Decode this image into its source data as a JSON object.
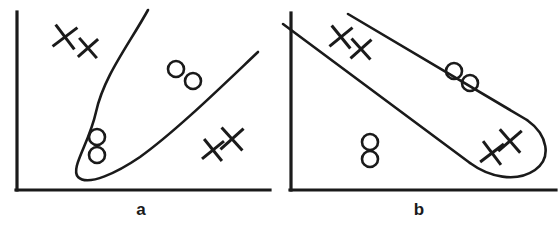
{
  "figure": {
    "background_color": "#ffffff",
    "ink_color": "#1a1a1a",
    "width": 559,
    "height": 231
  },
  "panels": [
    {
      "id": "panel-a",
      "label": "a",
      "label_position": {
        "x": 141,
        "y": 215
      },
      "axes": {
        "y_axis": {
          "x": 17,
          "y_top": 12,
          "y_bottom": 190
        },
        "x_axis": {
          "y": 190,
          "x_left": 17,
          "x_right": 270
        }
      },
      "boundary": {
        "shape": "open-u-curve",
        "description": "Elongated narrow U-shaped cluster boundary opening toward the upper right",
        "path": "M 148 10 C 128 46, 104 76, 96 112 C 89 144, 70 168, 78 177 C 88 187, 118 172, 140 157 C 176 131, 220 88, 258 52"
      },
      "points": {
        "circles": [
          {
            "cx": 97,
            "cy": 137,
            "r": 8,
            "inside_boundary": true
          },
          {
            "cx": 97,
            "cy": 155,
            "r": 8,
            "inside_boundary": true
          },
          {
            "cx": 176,
            "cy": 69,
            "r": 8,
            "inside_boundary": false
          },
          {
            "cx": 193,
            "cy": 81,
            "r": 8,
            "inside_boundary": false
          }
        ],
        "crosses": [
          {
            "cx": 65,
            "cy": 37,
            "size": 22,
            "rotation": 8
          },
          {
            "cx": 88,
            "cy": 48,
            "size": 19,
            "rotation": 4
          },
          {
            "cx": 213,
            "cy": 150,
            "size": 20,
            "rotation": 6
          },
          {
            "cx": 232,
            "cy": 139,
            "size": 22,
            "rotation": 3
          }
        ]
      }
    },
    {
      "id": "panel-b",
      "label": "b",
      "label_position": {
        "x": 419,
        "y": 215
      },
      "axes": {
        "y_axis": {
          "x": 291,
          "y_top": 13,
          "y_bottom": 190
        },
        "x_axis": {
          "y": 190,
          "x_left": 291,
          "x_right": 556
        }
      },
      "boundary": {
        "shape": "elongated-slanted-capsule",
        "description": "Long diagonal capsule-shaped cluster boundary sloping down to the right with a rounded tip",
        "upper_edge_path": "M 348 14 L 527 120",
        "lower_edge_path": "M 283 24 L 470 163",
        "tip_path": "M 527 120 C 548 135, 552 158, 535 170 C 516 183, 489 177, 470 163"
      },
      "points": {
        "circles": [
          {
            "cx": 454,
            "cy": 71,
            "r": 8,
            "inside_boundary": false
          },
          {
            "cx": 470,
            "cy": 83,
            "r": 8,
            "inside_boundary": false
          },
          {
            "cx": 370,
            "cy": 142,
            "r": 8,
            "inside_boundary": false
          },
          {
            "cx": 370,
            "cy": 159,
            "r": 8,
            "inside_boundary": false
          }
        ],
        "crosses": [
          {
            "cx": 341,
            "cy": 37,
            "size": 21,
            "rotation": 6
          },
          {
            "cx": 361,
            "cy": 49,
            "size": 20,
            "rotation": 3
          },
          {
            "cx": 492,
            "cy": 153,
            "size": 21,
            "rotation": 8
          },
          {
            "cx": 510,
            "cy": 141,
            "size": 22,
            "rotation": 4
          }
        ]
      }
    }
  ],
  "legend_semantics": {
    "circle_marker": "class-o-point",
    "cross_marker": "class-x-point"
  }
}
